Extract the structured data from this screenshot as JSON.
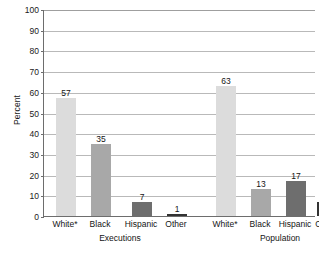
{
  "chart_data": {
    "type": "bar",
    "title": "",
    "subtitle": "",
    "xlabel": "",
    "ylabel": "Percent",
    "ylim": [
      0,
      100
    ],
    "ytick_step": 10,
    "ytick_labels": [
      "0",
      "10",
      "20",
      "30",
      "40",
      "50",
      "60",
      "70",
      "80",
      "90",
      "100"
    ],
    "grid": "horizontal",
    "legend": "none",
    "categories": [
      "White*",
      "Black",
      "Hispanic",
      "Other"
    ],
    "groups": [
      "Executions",
      "Population"
    ],
    "series": [
      {
        "name": "Executions",
        "values": [
          57,
          35,
          7,
          1
        ]
      },
      {
        "name": "Population",
        "values": [
          63,
          13,
          17,
          7
        ]
      }
    ],
    "bars": [
      {
        "group": "Executions",
        "category": "White*",
        "value": 57,
        "label": "57",
        "color": "#dcdcdc"
      },
      {
        "group": "Executions",
        "category": "Black",
        "value": 35,
        "label": "35",
        "color": "#a8a8a8"
      },
      {
        "group": "Executions",
        "category": "Hispanic",
        "value": 7,
        "label": "7",
        "color": "#6e6e6e"
      },
      {
        "group": "Executions",
        "category": "Other",
        "value": 1,
        "label": "1",
        "color": "#333333"
      },
      {
        "group": "Population",
        "category": "White*",
        "value": 63,
        "label": "63",
        "color": "#dcdcdc"
      },
      {
        "group": "Population",
        "category": "Black",
        "value": 13,
        "label": "13",
        "color": "#a8a8a8"
      },
      {
        "group": "Population",
        "category": "Hispanic",
        "value": 17,
        "label": "17",
        "color": "#6e6e6e"
      },
      {
        "group": "Population",
        "category": "Other",
        "value": 7,
        "label": "7",
        "color": "#333333"
      }
    ],
    "colors": {
      "white": "#dcdcdc",
      "black": "#a8a8a8",
      "hispanic": "#6e6e6e",
      "other": "#333333",
      "axis": "#6d6d6d",
      "grid": "#b9b9b9",
      "text": "#141414",
      "background": "#ffffff"
    }
  }
}
